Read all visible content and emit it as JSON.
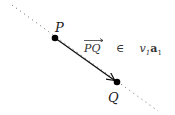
{
  "diagram": {
    "points": [
      {
        "label": "P",
        "x": 55,
        "y": 38
      },
      {
        "label": "Q",
        "x": 117,
        "y": 82
      }
    ],
    "line": {
      "style": "dotted",
      "from": [
        12,
        5
      ],
      "to": [
        158,
        111
      ]
    },
    "arrow": {
      "from": "P",
      "to": "Q"
    },
    "formula": {
      "vector": "PQ",
      "relation": "∈",
      "coefficient": "v",
      "coefficient_sub": "1",
      "basis": "a",
      "basis_sub": "1"
    },
    "colors": {
      "ink": "#111111",
      "dots": "#555555",
      "text": "#333333"
    }
  }
}
